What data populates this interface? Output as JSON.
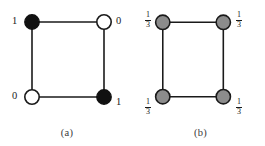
{
  "figure": {
    "type": "two-panel-graph-diagram",
    "panels": [
      {
        "caption": "(a)",
        "node_style": "binary",
        "nodes": [
          {
            "position": "top-left",
            "label": "1",
            "fill": "black",
            "label_side": "left"
          },
          {
            "position": "top-right",
            "label": "0",
            "fill": "white",
            "label_side": "right"
          },
          {
            "position": "bottom-left",
            "label": "0",
            "fill": "white",
            "label_side": "left"
          },
          {
            "position": "bottom-right",
            "label": "1",
            "fill": "black",
            "label_side": "right"
          }
        ],
        "edges": [
          "top-left -- top-right",
          "top-right -- bottom-right",
          "bottom-right -- bottom-left",
          "bottom-left -- top-left"
        ]
      },
      {
        "caption": "(b)",
        "node_style": "fractional",
        "nodes": [
          {
            "position": "top-left",
            "numerator": "1",
            "denominator": "3",
            "fill": "gray",
            "label_side": "left"
          },
          {
            "position": "top-right",
            "numerator": "1",
            "denominator": "3",
            "fill": "gray",
            "label_side": "right"
          },
          {
            "position": "bottom-left",
            "numerator": "1",
            "denominator": "3",
            "fill": "gray",
            "label_side": "left"
          },
          {
            "position": "bottom-right",
            "numerator": "1",
            "denominator": "3",
            "fill": "gray",
            "label_side": "right"
          }
        ],
        "edges": [
          "top-left -- top-right",
          "top-right -- bottom-right",
          "bottom-right -- bottom-left",
          "bottom-left -- top-left"
        ]
      }
    ],
    "colors": {
      "edge": "#1a1a1a",
      "node_black": "#111111",
      "node_white": "#ffffff",
      "node_gray": "#8c8c8c",
      "node_stroke": "#1a1a1a",
      "text": "#1a1a1a",
      "caption": "#3a3a3a",
      "background": "#ffffff"
    }
  }
}
